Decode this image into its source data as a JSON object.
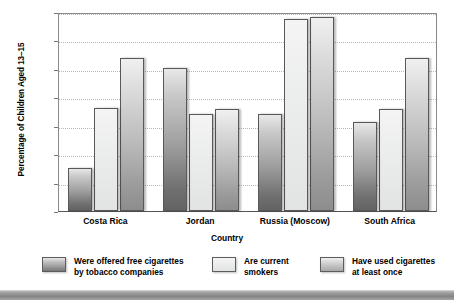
{
  "chart_data": {
    "type": "bar",
    "title": "",
    "xlabel": "Country",
    "ylabel": "Percentage of Children Aged 13–15",
    "categories": [
      "Costa Rica",
      "Jordan",
      "Russia (Moscow)",
      "South Africa"
    ],
    "series": [
      {
        "name": "Were offered free cigarettes\nby tobacco companies",
        "color": "#9d9d9d",
        "values": [
          7.5,
          25.2,
          17.1,
          15.6
        ]
      },
      {
        "name": "Are current\nsmokers",
        "color": "#eceded",
        "values": [
          18.2,
          17.0,
          33.8,
          18.0
        ]
      },
      {
        "name": "Have used cigarettes\nat least once",
        "color": "#bbbbbb",
        "values": [
          27.0,
          18.0,
          34.2,
          27.0
        ]
      }
    ],
    "ylim": [
      0,
      35
    ],
    "yticks": [
      "0",
      "5",
      "10",
      "15",
      "20",
      "25",
      "30",
      "35"
    ],
    "grid": true,
    "legend_position": "bottom"
  },
  "legend": {
    "items": [
      {
        "label": "Were offered free cigarettes\nby tobacco companies"
      },
      {
        "label": "Are current\nsmokers"
      },
      {
        "label": "Have used cigarettes\nat least once"
      }
    ]
  }
}
